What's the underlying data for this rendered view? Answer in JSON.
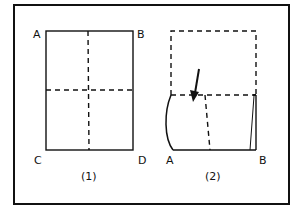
{
  "diagram": {
    "type": "paper-folding-steps",
    "colors": {
      "line": "#111111",
      "background": "#ffffff"
    },
    "panel1": {
      "caption": "(1)",
      "corners": {
        "top_left": "A",
        "top_right": "B",
        "bottom_left": "C",
        "bottom_right": "D"
      },
      "fold_lines": [
        "vertical-center-dashed",
        "horizontal-center-dashed"
      ]
    },
    "panel2": {
      "caption": "(2)",
      "corners": {
        "bottom_left": "A",
        "bottom_right": "B"
      },
      "notes": "Top half folded down along horizontal crease; arrow indicates fold direction"
    }
  }
}
